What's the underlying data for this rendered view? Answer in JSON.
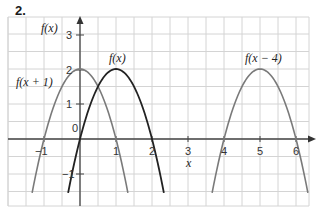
{
  "problem": {
    "number": "2."
  },
  "chart_data": {
    "type": "line",
    "title": "",
    "xlabel": "x",
    "ylabel": "f(x)",
    "xlim": [
      -2,
      6.3
    ],
    "ylim": [
      -1.9,
      3.5
    ],
    "grid": true,
    "grid_step": 0.5,
    "x_ticks": [
      "-1",
      "0",
      "1",
      "2",
      "3",
      "4",
      "5",
      "6"
    ],
    "y_ticks": [
      "3",
      "2",
      "1",
      "-1"
    ],
    "series": [
      {
        "name": "f(x+1)",
        "label": "f(x + 1)",
        "color": "#7a7a7a",
        "equation": "-2x^2 + 2",
        "vertex": [
          0,
          2
        ],
        "roots": [
          -1,
          1
        ],
        "x_range": [
          -1.33,
          1.33
        ]
      },
      {
        "name": "f(x)",
        "label": "f(x)",
        "color": "#222222",
        "equation": "-2(x-1)^2 + 2",
        "vertex": [
          1,
          2
        ],
        "roots": [
          0,
          2
        ],
        "x_range": [
          -0.33,
          2.33
        ]
      },
      {
        "name": "f(x-4)",
        "label": "f(x − 4)",
        "color": "#7a7a7a",
        "equation": "-2(x-5)^2 + 2",
        "vertex": [
          5,
          2
        ],
        "roots": [
          4,
          6
        ],
        "x_range": [
          3.67,
          6.33
        ]
      }
    ]
  },
  "labels": {
    "y_axis": "f(x)",
    "x_axis": "x",
    "fx1": "f(x + 1)",
    "fx": "f(x)",
    "fx4": "f(x − 4)",
    "tick_m1": "−1",
    "tick_0": "0",
    "tick_1": "1",
    "tick_2": "2",
    "tick_3": "3",
    "tick_4": "4",
    "tick_5": "5",
    "tick_6": "6",
    "ytick_3": "3",
    "ytick_2": "2",
    "ytick_1": "1",
    "ytick_m1": "−1"
  }
}
